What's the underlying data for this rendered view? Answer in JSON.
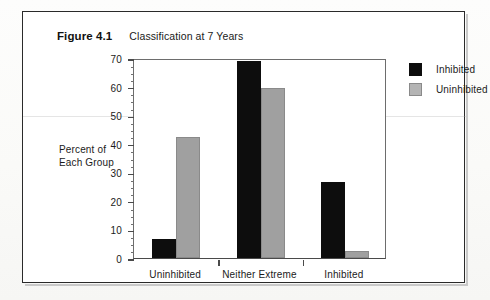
{
  "figure": {
    "label": "Figure 4.1",
    "title": "Classification at 7 Years"
  },
  "chart_data": {
    "type": "bar",
    "title": "Classification at 7 Years",
    "xlabel": "",
    "ylabel": "Percent of Each Group",
    "ylabel_lines": [
      "Percent of",
      "Each Group"
    ],
    "categories": [
      "Uninhibited",
      "Neither Extreme",
      "Inhibited"
    ],
    "series": [
      {
        "name": "Inhibited",
        "color": "#0d0d0d",
        "values": [
          6.5,
          69,
          26.5
        ]
      },
      {
        "name": "Uninhibited",
        "color": "#a0a0a0",
        "values": [
          42.5,
          59.5,
          2.5
        ]
      }
    ],
    "ylim": [
      0,
      70
    ],
    "ytick_values": [
      0,
      10,
      20,
      30,
      40,
      50,
      60,
      70
    ],
    "ytick_labels": [
      "0",
      "10",
      "20",
      "30",
      "40",
      "50",
      "60",
      "70"
    ],
    "yminor_step": 2.5,
    "grid": false,
    "legend_position": "right",
    "legend_entries": [
      "Inhibited",
      "Uninhibited"
    ]
  }
}
